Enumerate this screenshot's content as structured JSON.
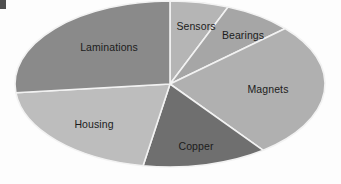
{
  "chart_data": {
    "type": "pie",
    "title": "",
    "subtitle": "",
    "xlabel": "",
    "ylabel": "",
    "legend_position": "none",
    "grid": false,
    "start_angle_deg": 0,
    "direction": "clockwise",
    "center": {
      "x": 170,
      "y": 84
    },
    "radius": {
      "x": 155,
      "y": 83
    },
    "categories": [
      "Sensors",
      "Bearings",
      "Magnets",
      "Copper",
      "Housing",
      "Laminations"
    ],
    "values": [
      6,
      7,
      26,
      13,
      21,
      27
    ],
    "unit": "percent",
    "series": [
      {
        "name": "Electric motor cost breakdown",
        "values": [
          6,
          7,
          26,
          13,
          21,
          27
        ]
      }
    ],
    "slices": [
      {
        "label": "Sensors",
        "value": 6,
        "start_angle_deg": 0,
        "end_angle_deg": 22,
        "color": "#b5b5b5",
        "label_x": 196,
        "label_y": 26
      },
      {
        "label": "Bearings",
        "value": 7,
        "start_angle_deg": 22,
        "end_angle_deg": 48,
        "color": "#a6a6a6",
        "label_x": 243,
        "label_y": 35
      },
      {
        "label": "Magnets",
        "value": 26,
        "start_angle_deg": 48,
        "end_angle_deg": 143,
        "color": "#b0b0b0",
        "label_x": 268,
        "label_y": 89
      },
      {
        "label": "Copper",
        "value": 13,
        "start_angle_deg": 143,
        "end_angle_deg": 190,
        "color": "#6f6f6f",
        "label_x": 196,
        "label_y": 146
      },
      {
        "label": "Housing",
        "value": 21,
        "start_angle_deg": 190,
        "end_angle_deg": 264,
        "color": "#bdbdbd",
        "label_x": 94,
        "label_y": 124
      },
      {
        "label": "Laminations",
        "value": 27,
        "start_angle_deg": 264,
        "end_angle_deg": 360,
        "color": "#8a8a8a",
        "label_x": 109,
        "label_y": 47
      }
    ],
    "colors": {
      "sensors": "#b5b5b5",
      "bearings": "#a6a6a6",
      "magnets": "#b0b0b0",
      "copper": "#6f6f6f",
      "housing": "#bdbdbd",
      "laminations": "#8a8a8a",
      "slice_border": "#f2f2f2",
      "background": "#fdfdfd",
      "label_text": "#1c1c1c"
    }
  }
}
